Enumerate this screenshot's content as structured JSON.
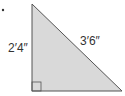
{
  "diagram": {
    "type": "right-triangle",
    "vertical_leg_label": "2′4″",
    "hypotenuse_label": "3′6″",
    "fill_color": "#d9d9d9",
    "stroke_color": "#555555",
    "bullet": "•"
  }
}
